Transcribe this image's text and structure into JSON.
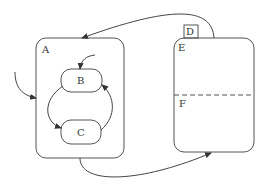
{
  "diagram": {
    "type": "statechart",
    "colors": {
      "stroke": "#555555",
      "text": "#333333",
      "background": "#ffffff"
    },
    "states": [
      {
        "id": "A",
        "label": "A",
        "kind": "composite",
        "children": [
          "B",
          "C"
        ]
      },
      {
        "id": "B",
        "label": "B",
        "kind": "simple",
        "parent": "A"
      },
      {
        "id": "C",
        "label": "C",
        "kind": "simple",
        "parent": "A"
      },
      {
        "id": "D",
        "label": "D",
        "kind": "tab"
      },
      {
        "id": "E",
        "label": "E",
        "kind": "orthogonal-region",
        "regions": [
          "E",
          "F"
        ]
      },
      {
        "id": "F",
        "label": "F",
        "kind": "region",
        "parent": "E"
      }
    ],
    "transitions": [
      {
        "from": "external",
        "to": "A",
        "style": "initial"
      },
      {
        "from": "initial",
        "to": "B",
        "style": "initial"
      },
      {
        "from": "B",
        "to": "C"
      },
      {
        "from": "C",
        "to": "B"
      },
      {
        "from": "A",
        "to": "E"
      },
      {
        "from": "E",
        "to": "A"
      }
    ]
  }
}
